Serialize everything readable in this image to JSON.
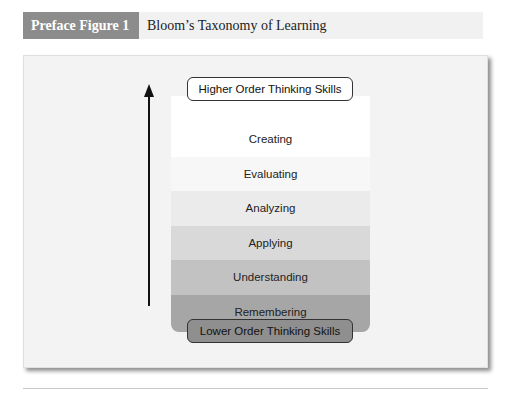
{
  "caption": {
    "label": "Preface Figure 1",
    "title": "Bloom’s Taxonomy of Learning"
  },
  "figure": {
    "top_label": "Higher Order Thinking Skills",
    "bottom_label": "Lower Order Thinking Skills",
    "arrow": "up-arrow",
    "layers": [
      {
        "label": "Creating",
        "color": "#ffffff"
      },
      {
        "label": "Evaluating",
        "color": "#f7f7f7"
      },
      {
        "label": "Analyzing",
        "color": "#ebebeb"
      },
      {
        "label": "Applying",
        "color": "#d9d9d9"
      },
      {
        "label": "Understanding",
        "color": "#c2c2c2"
      },
      {
        "label": "Remembering",
        "color": "#a6a6a6"
      }
    ]
  }
}
